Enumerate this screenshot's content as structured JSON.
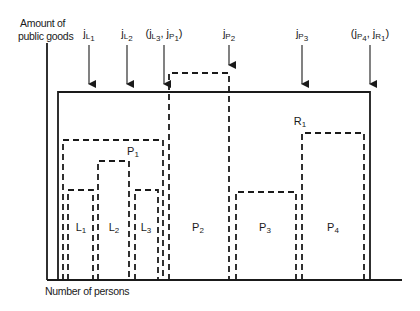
{
  "axes": {
    "y_label_line1": "Amount of",
    "y_label_line2": "public goods",
    "x_label": "Number of persons",
    "origin": {
      "x": 47,
      "y": 280
    },
    "y_top": 43,
    "x_end": 402,
    "color": "#1a1a1a"
  },
  "solid_region": {
    "name": "R1-outer",
    "x1": 58,
    "x2": 370,
    "top": 92,
    "bottom": 280
  },
  "dashed_regions": [
    {
      "id": "P1",
      "x1": 63,
      "x2": 163,
      "top": 140
    },
    {
      "id": "L1",
      "x1": 68,
      "x2": 93,
      "top": 190
    },
    {
      "id": "L2",
      "x1": 98,
      "x2": 129,
      "top": 161
    },
    {
      "id": "L3",
      "x1": 135,
      "x2": 158,
      "top": 190
    },
    {
      "id": "P2",
      "x1": 169,
      "x2": 229,
      "top": 73
    },
    {
      "id": "P3",
      "x1": 236,
      "x2": 296,
      "top": 192
    },
    {
      "id": "P4",
      "x1": 302,
      "x2": 364,
      "top": 133
    }
  ],
  "region_labels": [
    {
      "main": "L",
      "sub": "1",
      "x": 81,
      "y": 228
    },
    {
      "main": "L",
      "sub": "2",
      "x": 114,
      "y": 228
    },
    {
      "main": "L",
      "sub": "3",
      "x": 146,
      "y": 228
    },
    {
      "main": "P",
      "sub": "2",
      "x": 198,
      "y": 228
    },
    {
      "main": "P",
      "sub": "3",
      "x": 265,
      "y": 228
    },
    {
      "main": "P",
      "sub": "4",
      "x": 333,
      "y": 228
    },
    {
      "main": "P",
      "sub": "1",
      "x": 133,
      "y": 152
    },
    {
      "main": "R",
      "sub": "1",
      "x": 300,
      "y": 122
    }
  ],
  "arrows": [
    {
      "label_html": "j<sub>L<sub>1</sub></sub>",
      "text": "jL1",
      "x": 89,
      "label_y": 28,
      "y1": 45,
      "y2": 92
    },
    {
      "label_html": "j<sub>L<sub>2</sub></sub>",
      "text": "jL2",
      "x": 127,
      "label_y": 28,
      "y1": 45,
      "y2": 92
    },
    {
      "label_html": "(j<sub>L<sub>3</sub></sub>, j<sub>P<sub>1</sub></sub>)",
      "text": "(jL3, jP1)",
      "x": 164,
      "label_y": 28,
      "y1": 45,
      "y2": 92
    },
    {
      "label_html": "j<sub>P<sub>2</sub></sub>",
      "text": "jP2",
      "x": 229,
      "label_y": 28,
      "y1": 45,
      "y2": 73
    },
    {
      "label_html": "j<sub>P<sub>3</sub></sub>",
      "text": "jP3",
      "x": 302,
      "label_y": 28,
      "y1": 45,
      "y2": 92
    },
    {
      "label_html": "(j<sub>P<sub>4</sub></sub>, j<sub>R<sub>1</sub></sub>)",
      "text": "(jP4, jR1)",
      "x": 370,
      "label_y": 28,
      "y1": 45,
      "y2": 92
    }
  ],
  "style": {
    "ink": "#1a1a1a",
    "dash": "6,4",
    "stroke_width": 1.8
  }
}
